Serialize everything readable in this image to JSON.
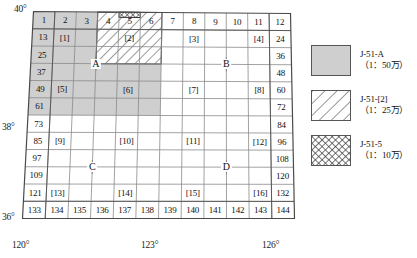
{
  "figure": {
    "type": "map-index-sheet-diagram",
    "axes": {
      "latitude_labels": [
        {
          "id": "lat-40",
          "text": "40°"
        },
        {
          "id": "lat-38",
          "text": "38°"
        },
        {
          "id": "lat-36",
          "text": "36°"
        }
      ],
      "longitude_labels": [
        {
          "id": "lon-120",
          "text": "120°"
        },
        {
          "id": "lon-123",
          "text": "123°"
        },
        {
          "id": "lon-126",
          "text": "126°"
        }
      ]
    },
    "grid": {
      "columns": 12,
      "rows": 12,
      "top_row_numbers": [
        "1",
        "2",
        "3",
        "4",
        "5",
        "6",
        "7",
        "8",
        "9",
        "10",
        "11",
        "12"
      ],
      "bottom_row_numbers": [
        "133",
        "134",
        "135",
        "136",
        "137",
        "138",
        "139",
        "140",
        "141",
        "142",
        "143",
        "144"
      ],
      "left_column_numbers": [
        "1",
        "13",
        "25",
        "37",
        "49",
        "61",
        "73",
        "85",
        "97",
        "109",
        "121",
        "133"
      ],
      "right_column_numbers": [
        "12",
        "24",
        "36",
        "48",
        "60",
        "72",
        "84",
        "96",
        "108",
        "120",
        "132",
        "144"
      ]
    },
    "sheet_tags": [
      {
        "label": "[1]",
        "row": 2,
        "col": 2
      },
      {
        "label": "[2]",
        "row": 2,
        "col": 5
      },
      {
        "label": "[3]",
        "row": 2,
        "col": 8
      },
      {
        "label": "[4]",
        "row": 2,
        "col": 11
      },
      {
        "label": "[5]",
        "row": 5,
        "col": 2
      },
      {
        "label": "[6]",
        "row": 5,
        "col": 5
      },
      {
        "label": "[7]",
        "row": 5,
        "col": 8
      },
      {
        "label": "[8]",
        "row": 5,
        "col": 11
      },
      {
        "label": "[9]",
        "row": 8,
        "col": 2
      },
      {
        "label": "[10]",
        "row": 8,
        "col": 5
      },
      {
        "label": "[11]",
        "row": 8,
        "col": 8
      },
      {
        "label": "[12]",
        "row": 8,
        "col": 11
      },
      {
        "label": "[13]",
        "row": 11,
        "col": 2
      },
      {
        "label": "[14]",
        "row": 11,
        "col": 5
      },
      {
        "label": "[15]",
        "row": 11,
        "col": 8
      },
      {
        "label": "[16]",
        "row": 11,
        "col": 11
      }
    ],
    "quadrant_marks": [
      {
        "label": "A",
        "row_line": 3,
        "col": 3
      },
      {
        "label": "B",
        "row_line": 3,
        "col": 9
      },
      {
        "label": "C",
        "row_line": 9,
        "col": 3
      },
      {
        "label": "D",
        "row_line": 9,
        "col": 9
      }
    ],
    "regions": {
      "shaded": {
        "name": "J-51-A",
        "col_from": 1,
        "col_to": 6,
        "row_from": 1,
        "row_to": 6
      },
      "hatched": {
        "name": "J-51-[2]",
        "col_from": 4,
        "col_to": 6,
        "row_from": 1,
        "row_to": 3
      },
      "crosshatched": {
        "name": "J-51-5",
        "col_from": 5,
        "col_to": 5,
        "row_from": 1,
        "row_to": 1
      }
    }
  },
  "legend": {
    "items": [
      {
        "swatch": "solid-grey",
        "name": "J-51-A",
        "scale": "（1：50万）"
      },
      {
        "swatch": "diagonal-hatch",
        "name": "J-51-[2]",
        "scale": "（1：25万）"
      },
      {
        "swatch": "cross-hatch",
        "name": "J-51-5",
        "scale": "（1：10万）"
      }
    ]
  },
  "colors": {
    "shade_fill": "#cfcfcf",
    "grid_line": "#8a8a8a",
    "grid_line_strong": "#5a5a5a",
    "text": "#111111",
    "background": "#ffffff"
  }
}
